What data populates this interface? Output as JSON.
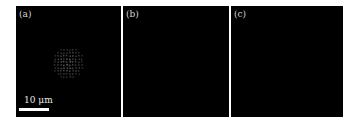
{
  "figure": {
    "panels": [
      {
        "id": "a",
        "label": "(a)",
        "content": "speckle spot pattern"
      },
      {
        "id": "b",
        "label": "(b)",
        "content": "dark"
      },
      {
        "id": "c",
        "label": "(c)",
        "content": "dark"
      }
    ],
    "scale_bar": {
      "label": "10 μm",
      "length_um": 10
    },
    "colors": {
      "background": "#000000",
      "foreground": "#ffffff",
      "border": "#ffffff"
    }
  }
}
